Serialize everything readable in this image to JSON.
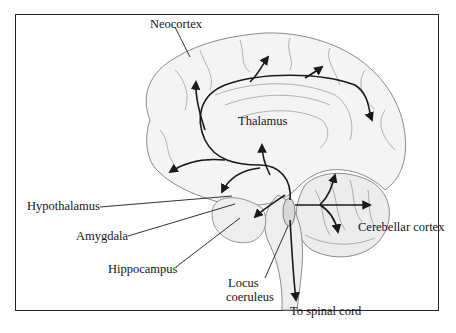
{
  "figure": {
    "colors": {
      "ink": "#1a1a1a",
      "sketch": "#8a8a8a",
      "background": "#ffffff",
      "frame": "#222222"
    }
  },
  "labels": {
    "neocortex": "Neocortex",
    "thalamus": "Thalamus",
    "hypothalamus": "Hypothalamus",
    "amygdala": "Amygdala",
    "hippocampus": "Hippocampus",
    "locus_line1": "Locus",
    "locus_line2": "coeruleus",
    "cerebellar_cortex": "Cerebellar cortex",
    "spinal_cord": "To spinal cord"
  }
}
